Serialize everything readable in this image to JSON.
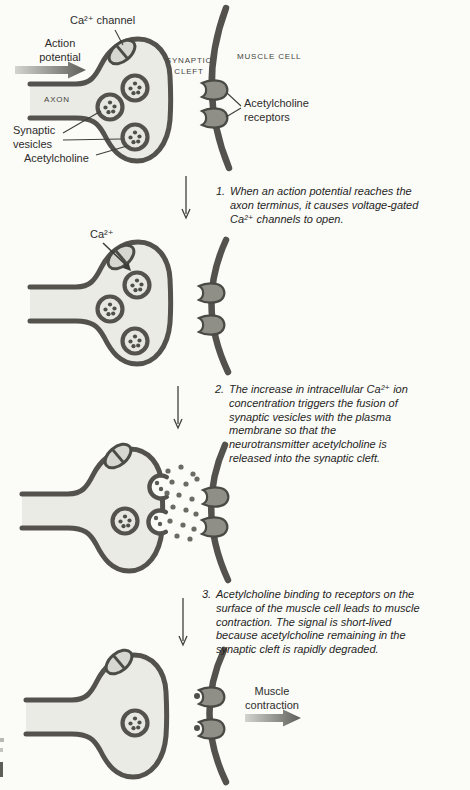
{
  "figure": {
    "title_hint": "Acetylcholine release at the neuromuscular junction (4-stage diagram)",
    "colors": {
      "background": "#fbfbf8",
      "ink": "#54524d",
      "terminal_fill": "#ebebe5",
      "receptor_fill": "#8f8f88",
      "channel_fill": "#d7d7d1",
      "text": "#2d2d2b"
    }
  },
  "panel1": {
    "labels": {
      "ca_channel": "Ca²⁺ channel",
      "action_potential": "Action potential",
      "axon": "AXON",
      "synaptic_vesicles": "Synaptic vesicles",
      "acetylcholine": "Acetylcholine",
      "synaptic_cleft": "SYNAPTIC CLEFT",
      "muscle_cell": "MUSCLE CELL",
      "ach_receptors": "Acetylcholine receptors"
    }
  },
  "panel2": {
    "labels": {
      "ca_ion": "Ca²⁺"
    }
  },
  "panel4": {
    "labels": {
      "muscle_contraction": "Muscle contraction"
    }
  },
  "steps": [
    {
      "number": "1.",
      "text": "When an action potential reaches the axon terminus, it causes voltage-gated Ca²⁺ channels to open.",
      "lines": [
        "When an action potential reaches the",
        "axon terminus, it causes voltage-gated",
        "Ca²⁺ channels to open."
      ]
    },
    {
      "number": "2.",
      "text": "The increase in intracellular Ca²⁺ ion concentration triggers the fusion of synaptic vesicles with the plasma membrane so that the neurotransmitter acetylcholine is released into the synaptic cleft.",
      "lines": [
        "The increase in intracellular Ca²⁺ ion",
        "concentration triggers the fusion of",
        "synaptic vesicles with the plasma",
        "membrane so that the",
        "neurotransmitter acetylcholine is",
        "released into the synaptic cleft."
      ]
    },
    {
      "number": "3.",
      "text": "Acetylcholine binding to receptors on the surface of the muscle cell leads to muscle contraction. The signal is short-lived because acetylcholine remaining in the synaptic cleft is rapidly degraded.",
      "lines": [
        "Acetylcholine binding to receptors on the",
        "surface of the muscle cell leads to muscle",
        "contraction. The signal is short-lived",
        "because acetylcholine remaining in the",
        "synaptic cleft is rapidly degraded."
      ]
    }
  ]
}
